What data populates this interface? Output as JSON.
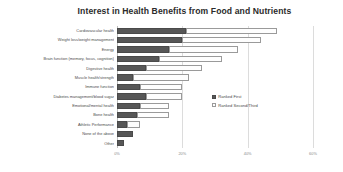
{
  "chart_data": {
    "type": "bar",
    "orientation": "horizontal",
    "stacked": true,
    "title": "Interest in Health Benefits from Food and Nutrients",
    "xlabel": "",
    "ylabel": "",
    "xlim": [
      0,
      60
    ],
    "xticks": [
      0,
      20,
      40,
      60
    ],
    "xticklabels": [
      "0%",
      "20%",
      "40%",
      "60%"
    ],
    "grid": true,
    "legend_position": "center-right",
    "categories": [
      "Cardiovascular health",
      "Weight loss/weight management",
      "Energy",
      "Brain function (memory, focus, cognition)",
      "Digestive health",
      "Muscle health/strength",
      "Immune function",
      "Diabetes management/blood sugar",
      "Emotional/mental health",
      "Bone health",
      "Athletic Performance",
      "None of the above",
      "Other"
    ],
    "series": [
      {
        "name": "Ranked First",
        "color": "#575757",
        "values": [
          21,
          20,
          16,
          13,
          9,
          5,
          7,
          9,
          7,
          6,
          3,
          5,
          2
        ]
      },
      {
        "name": "Ranked Second/Third",
        "color": "#FEFEFE",
        "values": [
          28,
          24,
          21,
          19,
          17,
          17,
          13,
          11,
          9,
          10,
          4,
          0,
          0
        ]
      }
    ]
  },
  "legend": {
    "items": [
      {
        "label": "Ranked First"
      },
      {
        "label": "Ranked Second/Third"
      }
    ]
  }
}
